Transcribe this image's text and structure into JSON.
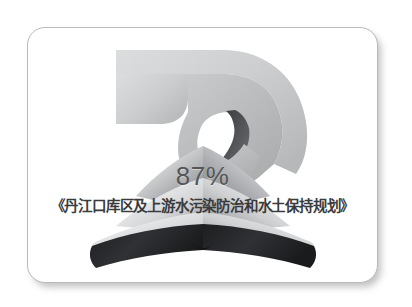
{
  "image": {
    "kind": "promotional-graphic-card",
    "background_color": "#ffffff",
    "card": {
      "background_color": "#ffffff",
      "border_color": "#b9b9b9",
      "shadow_color": "#787878",
      "corner_radius_px": 18
    }
  },
  "artwork": {
    "hand": {
      "label": "hand-reaching-down",
      "fill_light": "#d6d7d8",
      "fill_mid": "#c3c4c6",
      "fill_dark": "#a9abad",
      "accent_dark": "#3e3f42"
    },
    "book": {
      "label": "open-book",
      "page_light": "#fafafa",
      "page_mid": "#b9bbbd",
      "page_dark": "#6e7073",
      "cover_color": "#26272a"
    }
  },
  "overlay": {
    "percent_text": "87%",
    "percent_color": "#555658",
    "title_text": "《丹江口库区及上游水污染防治和水土保持规划》",
    "title_color": "#3a3b3d"
  }
}
